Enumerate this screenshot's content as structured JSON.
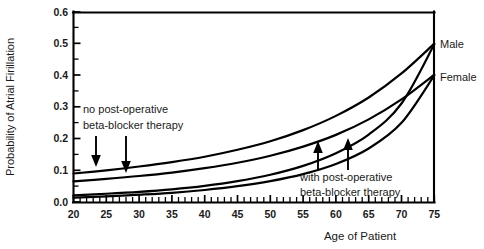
{
  "figure": {
    "name": "atrial-fibrillation-probability-by-age"
  },
  "chart_data": {
    "type": "line",
    "title": "",
    "xlabel": "Age of Patient",
    "ylabel": "Probability of Atrial Firillation",
    "xlim": [
      20,
      75
    ],
    "ylim": [
      0.0,
      0.6
    ],
    "xticks": [
      20,
      25,
      30,
      35,
      40,
      45,
      50,
      55,
      60,
      65,
      70,
      75
    ],
    "xtick_labels": [
      "20",
      "25",
      "30",
      "35",
      "40",
      "45",
      "50",
      "55",
      "60",
      "65",
      "70",
      "75"
    ],
    "x_minor_tick_step": 1,
    "yticks": [
      0.0,
      0.1,
      0.2,
      0.3,
      0.4,
      0.5,
      0.6
    ],
    "ytick_labels": [
      "0.0",
      "0.1",
      "0.2",
      "0.3",
      "0.4",
      "0.5",
      "0.6"
    ],
    "y_minor_tick_step": 0.05,
    "grid": false,
    "legend_position": "right-edge-inline",
    "x": [
      20,
      25,
      30,
      35,
      40,
      45,
      50,
      55,
      60,
      65,
      70,
      75
    ],
    "series": [
      {
        "name": "Male, no post-operative beta-blocker therapy",
        "group": "no post-operative beta-blocker therapy",
        "sex": "Male",
        "endpoint_label": "Male",
        "values": [
          0.09,
          0.1,
          0.112,
          0.126,
          0.143,
          0.165,
          0.192,
          0.227,
          0.272,
          0.33,
          0.406,
          0.5
        ]
      },
      {
        "name": "Female, no post-operative beta-blocker therapy",
        "group": "no post-operative beta-blocker therapy",
        "sex": "Female",
        "endpoint_label": "Female",
        "values": [
          0.065,
          0.073,
          0.082,
          0.093,
          0.107,
          0.124,
          0.146,
          0.175,
          0.212,
          0.261,
          0.324,
          0.402
        ]
      },
      {
        "name": "Male, with post-operative beta-blocker therapy",
        "group": "with post-operative beta-blocker therapy",
        "sex": "Male",
        "endpoint_label": "Male",
        "values": [
          0.021,
          0.026,
          0.032,
          0.04,
          0.051,
          0.066,
          0.086,
          0.114,
          0.154,
          0.213,
          0.311,
          0.498
        ]
      },
      {
        "name": "Female, with post-operative beta-blocker therapy",
        "group": "with post-operative beta-blocker therapy",
        "sex": "Female",
        "endpoint_label": "Female",
        "values": [
          0.014,
          0.018,
          0.023,
          0.029,
          0.038,
          0.05,
          0.066,
          0.088,
          0.12,
          0.169,
          0.25,
          0.4
        ]
      }
    ],
    "annotations": [
      {
        "id": "annot-no-therapy",
        "text_lines": [
          "no post-operative",
          "beta-blocker therapy"
        ],
        "arrow_direction": "down",
        "arrow_count": 2,
        "points_to": [
          "Male, no post-operative beta-blocker therapy",
          "Female, no post-operative beta-blocker therapy"
        ]
      },
      {
        "id": "annot-with-therapy",
        "text_lines": [
          "with post-operative",
          "beta-blocker therapy"
        ],
        "arrow_direction": "up",
        "arrow_count": 2,
        "points_to": [
          "Male, with post-operative beta-blocker therapy",
          "Female, with post-operative beta-blocker therapy"
        ]
      }
    ],
    "endpoint_labels": [
      {
        "text": "Male",
        "value": 0.5
      },
      {
        "text": "Female",
        "value": 0.4
      }
    ]
  },
  "axes": {
    "x_title": "Age of Patient",
    "y_title": "Probability of Atrial Firillation",
    "x_tick_labels": [
      "20",
      "25",
      "30",
      "35",
      "40",
      "45",
      "50",
      "55",
      "60",
      "65",
      "70",
      "75"
    ],
    "y_tick_labels": [
      "0.0",
      "0.1",
      "0.2",
      "0.3",
      "0.4",
      "0.5",
      "0.6"
    ]
  },
  "annotation_text": {
    "no_therapy_line1": "no post-operative",
    "no_therapy_line2": "beta-blocker therapy",
    "with_therapy_line1": "with post-operative",
    "with_therapy_line2": "beta-blocker therapy"
  },
  "series_labels": {
    "male": "Male",
    "female": "Female"
  },
  "colors": {
    "curve": "#000000",
    "axis": "#000000",
    "text": "#1a1a1a",
    "background": "#ffffff"
  }
}
